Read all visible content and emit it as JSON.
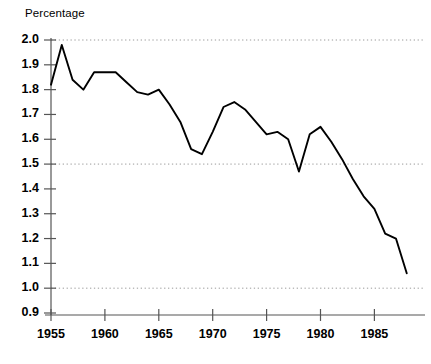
{
  "chart_data": {
    "type": "line",
    "title": "Percentage",
    "xlabel": "",
    "ylabel": "Percentage",
    "xlim": [
      1955,
      1988
    ],
    "ylim": [
      0.9,
      2.0
    ],
    "grid": "horizontal-dotted",
    "gridlines_y": [
      2.0,
      1.5,
      1.0
    ],
    "legend": null,
    "legend_position": "none",
    "line_color": "#000000",
    "x": [
      1955,
      1956,
      1957,
      1958,
      1959,
      1960,
      1961,
      1962,
      1963,
      1964,
      1965,
      1966,
      1967,
      1968,
      1969,
      1970,
      1971,
      1972,
      1973,
      1974,
      1975,
      1976,
      1977,
      1978,
      1979,
      1980,
      1981,
      1982,
      1983,
      1984,
      1985,
      1986,
      1987,
      1988
    ],
    "values": [
      1.82,
      1.98,
      1.84,
      1.8,
      1.87,
      1.87,
      1.87,
      1.83,
      1.79,
      1.78,
      1.8,
      1.74,
      1.67,
      1.56,
      1.54,
      1.63,
      1.73,
      1.75,
      1.72,
      1.67,
      1.62,
      1.63,
      1.6,
      1.47,
      1.62,
      1.65,
      1.59,
      1.52,
      1.44,
      1.37,
      1.32,
      1.22,
      1.2,
      1.06
    ],
    "yticks": [
      "2.0",
      "1.9",
      "1.8",
      "1.7",
      "1.6",
      "1.5",
      "1.4",
      "1.3",
      "1.2",
      "1.1",
      "1.0",
      "0.9"
    ],
    "ytick_values": [
      2.0,
      1.9,
      1.8,
      1.7,
      1.6,
      1.5,
      1.4,
      1.3,
      1.2,
      1.1,
      1.0,
      0.9
    ],
    "xticks": [
      "1955",
      "1960",
      "1965",
      "1970",
      "1975",
      "1980",
      "1985"
    ],
    "xtick_values": [
      1955,
      1960,
      1965,
      1970,
      1975,
      1980,
      1985
    ]
  }
}
